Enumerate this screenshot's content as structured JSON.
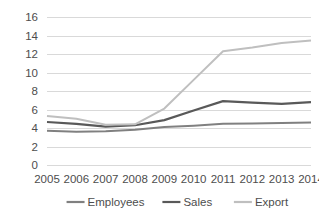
{
  "chart_data": {
    "type": "line",
    "title": "",
    "subtitle": "",
    "xlabel": "",
    "ylabel": "",
    "categories": [
      "2005",
      "2006",
      "2007",
      "2008",
      "2009",
      "2010",
      "2011",
      "2012",
      "2013",
      "2014"
    ],
    "ylim": [
      0,
      16
    ],
    "y_ticks": [
      0,
      2,
      4,
      6,
      8,
      10,
      12,
      14,
      16
    ],
    "y_tick_labels": [
      "0",
      "2",
      "4",
      "6",
      "8",
      "10",
      "12",
      "14",
      "16"
    ],
    "grid": {
      "horizontal": true,
      "vertical": false,
      "color": "#d9d9d9"
    },
    "legend": {
      "position": "bottom",
      "entries": [
        {
          "name": "Employees",
          "color": "#808080"
        },
        {
          "name": "Sales",
          "color": "#595959"
        },
        {
          "name": "Export",
          "color": "#bfbfbf"
        }
      ]
    },
    "series": [
      {
        "name": "Employees",
        "color": "#808080",
        "width": 2,
        "values": [
          3.7,
          3.6,
          3.65,
          3.8,
          4.1,
          4.25,
          4.45,
          4.5,
          4.55,
          4.6
        ]
      },
      {
        "name": "Sales",
        "color": "#595959",
        "width": 2.2,
        "values": [
          4.65,
          4.45,
          4.15,
          4.3,
          4.85,
          5.9,
          6.9,
          6.75,
          6.6,
          6.8
        ]
      },
      {
        "name": "Export",
        "color": "#bfbfbf",
        "width": 2,
        "values": [
          5.3,
          5.0,
          4.35,
          4.4,
          6.1,
          9.2,
          12.3,
          12.7,
          13.2,
          13.45
        ]
      }
    ]
  },
  "axes": {
    "tick_label_color": "#4d4d4d",
    "plot_background": "#ffffff"
  }
}
